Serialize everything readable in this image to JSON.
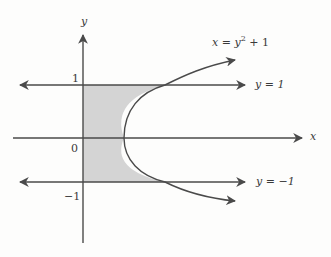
{
  "figure": {
    "axes": {
      "x_label": "x",
      "y_label": "y"
    },
    "ticks": {
      "y_one": "1",
      "origin": "0",
      "y_neg_one": "−1"
    },
    "curves": {
      "parabola": {
        "label_lhs": "x = y",
        "label_exp": "2",
        "label_rhs": " + 1"
      },
      "line_top": {
        "label": "y = 1"
      },
      "line_bottom": {
        "label": "y = −1"
      }
    },
    "region": {
      "fill": "#d4d4d4",
      "description": "Shaded region bounded by y-axis, y = 1, y = −1 and x = y² + 1"
    },
    "colors": {
      "stroke": "#4a4a4a",
      "shade": "#d4d4d4",
      "background": "#fdfdfc"
    }
  }
}
